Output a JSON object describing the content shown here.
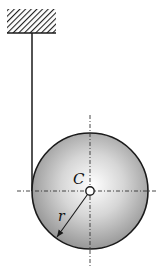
{
  "diagram": {
    "type": "physics-mechanics",
    "labels": {
      "center": "C",
      "radius": "r"
    },
    "elements": {
      "ceiling": {
        "x": 7,
        "y": 9,
        "width": 49,
        "height": 24,
        "style": "hatched"
      },
      "string": {
        "x": 32,
        "y_top": 33,
        "y_bottom": 191
      },
      "disk": {
        "cx": 90,
        "cy": 191,
        "r": 58,
        "shading": "radial-gradient",
        "fill_light": "#ffffff",
        "fill_dark": "#8a8a8a"
      },
      "center_pin": {
        "cx": 90,
        "cy": 191,
        "r": 4
      },
      "centerlines": {
        "horizontal": {
          "x1": 17,
          "x2": 157
        },
        "vertical": {
          "y1": 115,
          "y2": 266
        }
      },
      "radius_arrow": {
        "from": [
          90,
          191
        ],
        "to": [
          57,
          237
        ]
      }
    },
    "colors": {
      "line": "#1a1a1a",
      "background": "#ffffff"
    }
  }
}
